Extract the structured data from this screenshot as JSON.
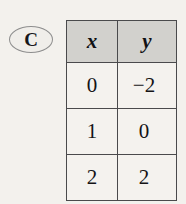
{
  "problem": {
    "label": "C",
    "label_shape": "oval"
  },
  "colors": {
    "page_background": "#f3f1ed",
    "header_fill": "#d2d1cd",
    "cell_fill": "#f4f2ee",
    "border": "#4a4a4c",
    "oval_stroke": "#8e8e8e",
    "text": "#141416"
  },
  "table": {
    "headers": [
      "x",
      "y"
    ],
    "rows": [
      {
        "x": "0",
        "y": "−2"
      },
      {
        "x": "1",
        "y": "0"
      },
      {
        "x": "2",
        "y": "2"
      }
    ]
  },
  "chart_data": {
    "type": "table",
    "title": "",
    "xlabel": "x",
    "ylabel": "y",
    "categories": [
      "0",
      "1",
      "2"
    ],
    "x": [
      0,
      1,
      2
    ],
    "values": [
      -2,
      0,
      2
    ],
    "series": [
      {
        "name": "y",
        "values": [
          -2,
          0,
          2
        ]
      }
    ],
    "annotations": [
      "C"
    ],
    "grid": true,
    "legend": "none"
  }
}
